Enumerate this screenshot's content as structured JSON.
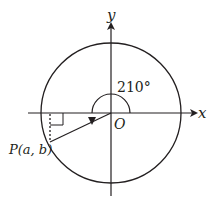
{
  "diagram": {
    "type": "unit-circle-angle",
    "axis_labels": {
      "x": "x",
      "y": "y"
    },
    "origin_label": "O",
    "angle_label": "210°",
    "angle_degrees": 210,
    "point": {
      "name": "P",
      "coords_label": "(a, b)",
      "full_label": "P(a, b)"
    },
    "colors": {
      "stroke": "#231f20",
      "background": "#ffffff"
    }
  }
}
